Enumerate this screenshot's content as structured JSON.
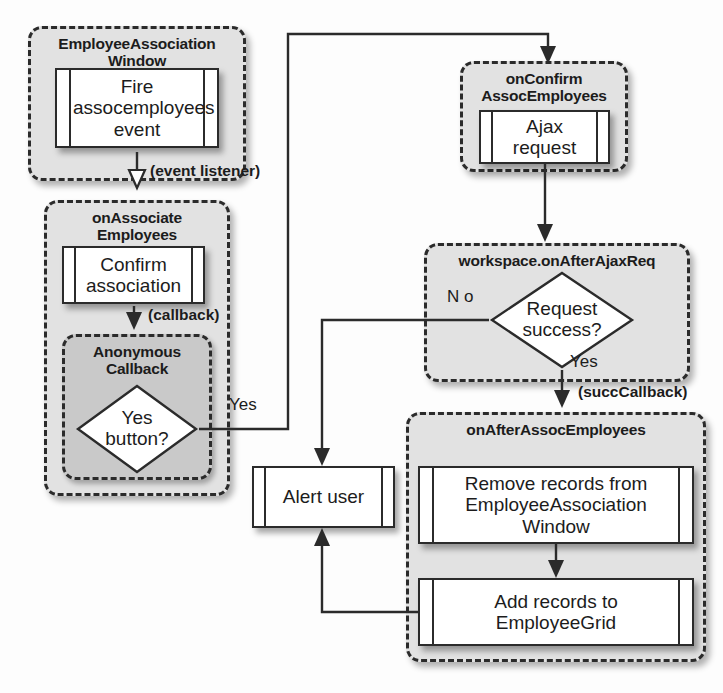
{
  "diagram": {
    "type": "flowchart",
    "title": "",
    "colors": {
      "scope_outer_fill": "#e2e2e2",
      "scope_inner_fill": "#c9c9c9",
      "node_fill": "#ffffff",
      "stroke": "#2b2b2b",
      "page_background": "#fdfdfd"
    },
    "scopes": [
      {
        "id": "employee_association_window",
        "title": "EmployeeAssociation\nWindow",
        "title_line1": "EmployeeAssociation",
        "title_line2": "Window"
      },
      {
        "id": "on_associate_employees",
        "title": "onAssociate\nEmployees",
        "title_line1": "onAssociate",
        "title_line2": "Employees"
      },
      {
        "id": "anonymous_callback",
        "title": "Anonymous\nCallback",
        "title_line1": "Anonymous",
        "title_line2": "Callback"
      },
      {
        "id": "on_confirm_assoc_employees",
        "title": "onConfirm\nAssocEmployees",
        "title_line1": "onConfirm",
        "title_line2": "AssocEmployees"
      },
      {
        "id": "workspace_on_after_ajax_req",
        "title": "workspace.onAfterAjaxReq",
        "title_line1": "workspace.onAfterAjaxReq",
        "title_line2": ""
      },
      {
        "id": "on_after_assoc_employees",
        "title": "onAfterAssocEmployees",
        "title_line1": "onAfterAssocEmployees",
        "title_line2": ""
      }
    ],
    "nodes": [
      {
        "id": "fire_event",
        "shape": "subroutine",
        "text": "Fire\nassocemployees\nevent",
        "line1": "Fire",
        "line2": "assocemployees",
        "line3": "event"
      },
      {
        "id": "confirm_association",
        "shape": "subroutine",
        "text": "Confirm\nassociation",
        "line1": "Confirm",
        "line2": "association",
        "line3": ""
      },
      {
        "id": "yes_button",
        "shape": "decision",
        "text": "Yes\nbutton?",
        "line1": "Yes",
        "line2": "button?"
      },
      {
        "id": "ajax_request",
        "shape": "subroutine",
        "text": "Ajax\nrequest",
        "line1": "Ajax",
        "line2": "request",
        "line3": ""
      },
      {
        "id": "request_success",
        "shape": "decision",
        "text": "Request\nsuccess?",
        "line1": "Request",
        "line2": "success?"
      },
      {
        "id": "alert_user",
        "shape": "subroutine",
        "text": "Alert user",
        "line1": "Alert user",
        "line2": "",
        "line3": ""
      },
      {
        "id": "remove_records",
        "shape": "subroutine",
        "text": "Remove records from\nEmployeeAssociation\nWindow",
        "line1": "Remove records from",
        "line2": "EmployeeAssociation",
        "line3": "Window"
      },
      {
        "id": "add_records",
        "shape": "subroutine",
        "text": "Add records to\nEmployeeGrid",
        "line1": "Add records to",
        "line2": "EmployeeGrid",
        "line3": ""
      }
    ],
    "edges": [
      {
        "id": "fire_to_onassociate",
        "from": "fire_event",
        "to": "on_associate_employees",
        "label": "(event listener)",
        "arrow": "hollow"
      },
      {
        "id": "confirm_to_callback",
        "from": "confirm_association",
        "to": "anonymous_callback",
        "label": "(callback)",
        "arrow": "solid"
      },
      {
        "id": "yesbutton_to_onconfirm",
        "from": "yes_button",
        "to": "on_confirm_assoc_employees",
        "label": "Yes",
        "arrow": "solid"
      },
      {
        "id": "ajax_to_onafterajax",
        "from": "ajax_request",
        "to": "workspace_on_after_ajax_req",
        "label": "",
        "arrow": "solid"
      },
      {
        "id": "success_no_to_alert",
        "from": "request_success",
        "to": "alert_user",
        "label": "No",
        "arrow": "solid"
      },
      {
        "id": "success_yes_to_onafterassoc",
        "from": "request_success",
        "to": "on_after_assoc_employees",
        "label": "Yes",
        "arrow": "solid"
      },
      {
        "id": "succ_callback",
        "from": "workspace_on_after_ajax_req",
        "to": "on_after_assoc_employees",
        "label": "(succCallback)",
        "arrow": "solid"
      },
      {
        "id": "remove_to_add",
        "from": "remove_records",
        "to": "add_records",
        "label": "",
        "arrow": "solid"
      },
      {
        "id": "add_to_alert",
        "from": "add_records",
        "to": "alert_user",
        "label": "",
        "arrow": "solid"
      }
    ],
    "labels": {
      "event_listener": "(event listener)",
      "callback": "(callback)",
      "yes_from_button": "Yes",
      "no_from_success": "N o",
      "yes_from_success": "Yes",
      "succ_callback": "(succCallback)"
    }
  }
}
